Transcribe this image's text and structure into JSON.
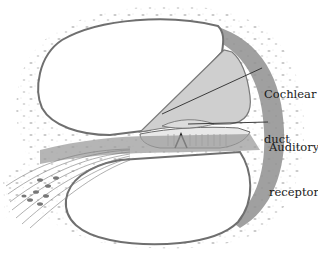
{
  "figure": {
    "labels": [
      {
        "id": "cochlear-duct",
        "lines": [
          "Cochlear",
          "duct"
        ]
      },
      {
        "id": "auditory-receptors",
        "lines": [
          "Auditory",
          "receptors"
        ]
      }
    ],
    "colors": {
      "background": "#ffffff",
      "bone_stipple": "#c8c8c8",
      "membrane_wall": "#7a7a7a",
      "duct_fill": "#cfcfcf",
      "dark_tissue": "#8f8f8f",
      "leader_line": "#2a2a2a",
      "text": "#1a1a1a"
    }
  }
}
